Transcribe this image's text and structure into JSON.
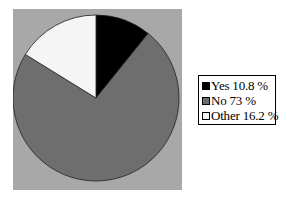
{
  "chart_data": {
    "type": "pie",
    "title": "",
    "slices": [
      {
        "label": "Yes",
        "value": 10.8,
        "color": "#000000",
        "legend_text": "Yes 10.8 %"
      },
      {
        "label": "No",
        "value": 73,
        "color": "#6e6e6e",
        "legend_text": "No 73 %"
      },
      {
        "label": "Other",
        "value": 16.2,
        "color": "#f5f5f5",
        "legend_text": "Other 16.2 %"
      }
    ],
    "start_angle": "12 o'clock, clockwise",
    "background": "#a8a8a8",
    "legend_position": "right"
  }
}
